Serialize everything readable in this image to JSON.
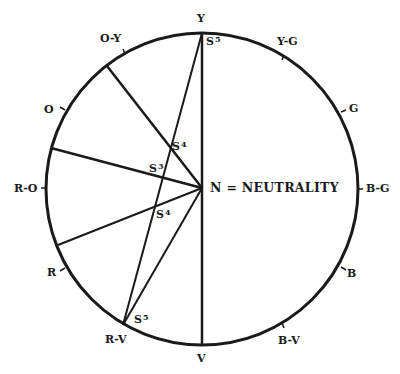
{
  "diagram": {
    "center_label": "N = NEUTRALITY",
    "hue_labels": {
      "Y": "Y",
      "YG": "Y-G",
      "G": "G",
      "BG": "B-G",
      "B": "B",
      "BV": "B-V",
      "V": "V",
      "RV": "R-V",
      "R": "R",
      "RO": "R-O",
      "O": "O",
      "OY": "O-Y"
    },
    "saturation_labels": [
      {
        "base": "S",
        "exp": "5",
        "near": "Y"
      },
      {
        "base": "S",
        "exp": "4",
        "near": "upper-chord"
      },
      {
        "base": "S",
        "exp": "3",
        "near": "middle-chord"
      },
      {
        "base": "S",
        "exp": "4",
        "near": "lower-chord"
      },
      {
        "base": "S",
        "exp": "5",
        "near": "R-V"
      }
    ],
    "colors": {
      "ink": "#1a1a1a",
      "background": "#ffffff"
    }
  }
}
